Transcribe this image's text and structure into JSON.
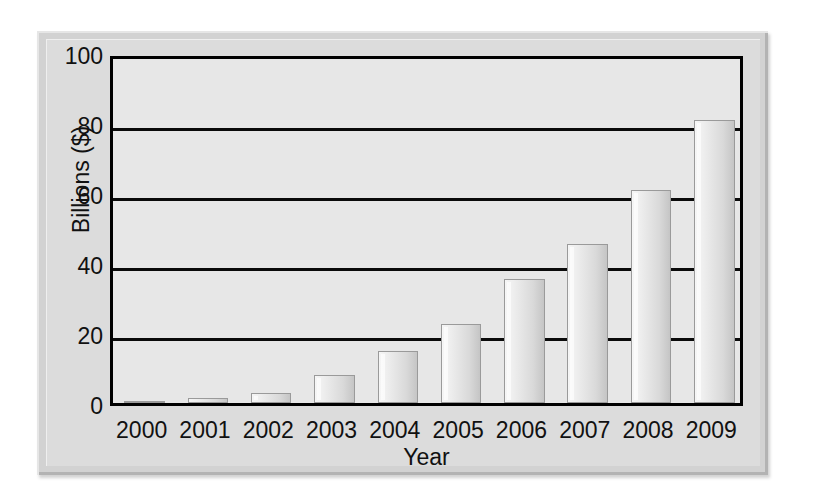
{
  "chart_data": {
    "type": "bar",
    "title": "",
    "xlabel": "Year",
    "ylabel": "Billions ($)",
    "categories": [
      "2000",
      "2001",
      "2002",
      "2003",
      "2004",
      "2005",
      "2006",
      "2007",
      "2008",
      "2009"
    ],
    "values": [
      0.5,
      1.5,
      3,
      8,
      15,
      22.5,
      35.5,
      45.5,
      61,
      81
    ],
    "ylim": [
      0,
      100
    ],
    "yticks": [
      0,
      20,
      40,
      60,
      80,
      100
    ],
    "ytick_labels": [
      "0",
      "20",
      "40",
      "60",
      "80",
      "100"
    ],
    "grid": "horizontal",
    "legend": "none",
    "series": [
      {
        "name": "Billions ($)",
        "values": [
          0.5,
          1.5,
          3,
          8,
          15,
          22.5,
          35.5,
          45.5,
          61,
          81
        ]
      }
    ]
  },
  "figure": {
    "plate_color": "#d2d2d2",
    "plot_background": "#e7e7e7",
    "axis_color": "#000000",
    "bar_fill_light": "#f6f6f6",
    "bar_fill_dark": "#c5c5c5",
    "bar_border": "#9a9a9a",
    "text_color": "#111111"
  }
}
